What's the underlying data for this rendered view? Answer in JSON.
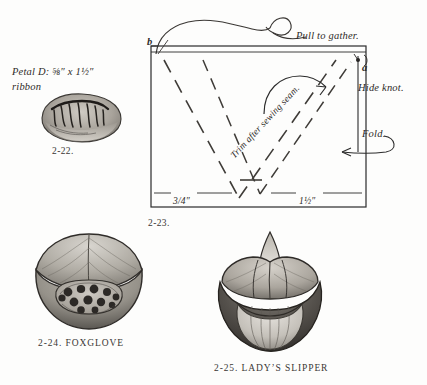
{
  "page": {
    "kind": "craft-instruction-plate",
    "background_color": "#fdfdfc",
    "ink_color": "#2b2b2b"
  },
  "petal_label": {
    "line1": "Petal D: ⅝″ x 1½″",
    "line2": "ribbon"
  },
  "figures": [
    {
      "id": "2-22",
      "caption": "2-22.",
      "name": "",
      "full": "2-22."
    },
    {
      "id": "2-23",
      "caption": "2-23.",
      "name": "",
      "full": "2-23."
    },
    {
      "id": "2-24",
      "caption": "2-24.",
      "name": "FOXGLOVE",
      "full": "2-24.  FOXGLOVE"
    },
    {
      "id": "2-25",
      "caption": "2-25.",
      "name": "LADY’S SLIPPER",
      "full": "2-25.  LADY’S SLIPPER"
    }
  ],
  "diagram": {
    "point_a": "a",
    "point_b": "b",
    "labels": {
      "pull": "Pull to gather.",
      "hide": "Hide knot.",
      "fold": "Fold.",
      "trim": "Trim after sewing seam."
    },
    "measurements": {
      "left": "3⁄₄″",
      "right": "1½″"
    },
    "measurement_left_plain": "3/4″",
    "measurement_right_plain": "1½″"
  },
  "illustrations": {
    "petal_d": "gathered-ribbon-petal",
    "foxglove": "foxglove-flower",
    "ladys_slipper": "ladys-slipper-orchid"
  }
}
